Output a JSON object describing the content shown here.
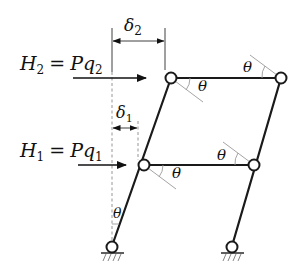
{
  "diagram": {
    "loads": [
      {
        "id": "H2",
        "lhs_main": "H",
        "lhs_sub": "2",
        "eq": "=",
        "rhs_main": "Pq",
        "rhs_sub": "2"
      },
      {
        "id": "H1",
        "lhs_main": "H",
        "lhs_sub": "1",
        "eq": "=",
        "rhs_main": "Pq",
        "rhs_sub": "1"
      }
    ],
    "dimensions": [
      {
        "id": "delta2",
        "main": "δ",
        "sub": "2"
      },
      {
        "id": "delta1",
        "main": "δ",
        "sub": "1"
      }
    ],
    "angle_label": "θ",
    "angles": [
      {
        "id": "upper-left-theta",
        "label": "θ"
      },
      {
        "id": "upper-right-theta",
        "label": "θ"
      },
      {
        "id": "lower-left-theta",
        "label": "θ"
      },
      {
        "id": "lower-right-theta",
        "label": "θ"
      },
      {
        "id": "base-theta",
        "label": "θ"
      }
    ],
    "colors": {
      "line": "#1a1a1a",
      "construction": "#9a9a9a",
      "background": "#ffffff"
    }
  }
}
